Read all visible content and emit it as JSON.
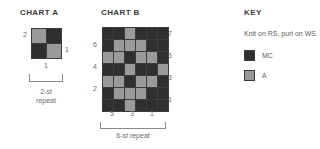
{
  "colors": {
    "mc": "#2f2f2f",
    "a": "#9a9a9a",
    "grid_line": "#3d3d3d",
    "text": "#5d5d5d",
    "title": "#3a3a3a"
  },
  "chart_a": {
    "title": "CHART A",
    "type": "knitting-colorwork-chart",
    "stitches": 2,
    "rows": 2,
    "row_labels_left": [
      "2"
    ],
    "row_labels_right": [
      "1"
    ],
    "col_labels_bottom": [
      "1"
    ],
    "repeat_label": "2-st\nrepeat",
    "legend_map": {
      "mc": "MC",
      "a": "A"
    },
    "cells": [
      [
        "a",
        "mc"
      ],
      [
        "mc",
        "a"
      ]
    ]
  },
  "chart_b": {
    "title": "CHART B",
    "type": "knitting-colorwork-chart",
    "stitches": 6,
    "rows": 7,
    "row_labels_left": [
      "6",
      "4",
      "2"
    ],
    "row_labels_right": [
      "7",
      "5",
      "3",
      "1"
    ],
    "col_labels_bottom": [
      "5",
      "3",
      "1"
    ],
    "repeat_label": "6-st repeat",
    "legend_map": {
      "mc": "MC",
      "a": "A"
    },
    "cells": [
      [
        "mc",
        "mc",
        "a",
        "mc",
        "mc",
        "mc"
      ],
      [
        "mc",
        "a",
        "a",
        "a",
        "mc",
        "mc"
      ],
      [
        "a",
        "a",
        "mc",
        "a",
        "a",
        "mc"
      ],
      [
        "mc",
        "mc",
        "a",
        "mc",
        "mc",
        "a"
      ],
      [
        "a",
        "a",
        "mc",
        "a",
        "a",
        "mc"
      ],
      [
        "mc",
        "a",
        "a",
        "a",
        "mc",
        "mc"
      ],
      [
        "mc",
        "mc",
        "a",
        "mc",
        "mc",
        "mc"
      ]
    ]
  },
  "key": {
    "title": "KEY",
    "note": "Knit on RS, purl on WS.",
    "items": [
      {
        "swatch": "mc",
        "label": "MC"
      },
      {
        "swatch": "a",
        "label": "A"
      }
    ]
  }
}
